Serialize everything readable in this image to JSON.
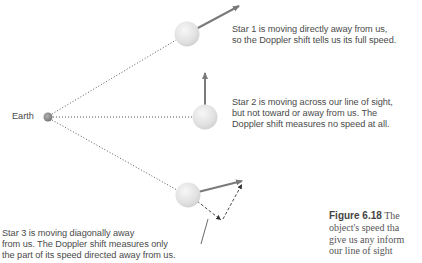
{
  "earth": {
    "label": "Earth"
  },
  "stars": [
    {
      "id": 1,
      "text_lines": [
        "Star 1 is moving directly away from us,",
        "so the Doppler shift tells us its full speed."
      ]
    },
    {
      "id": 2,
      "text_lines": [
        "Star 2 is moving across our line of sight,",
        "but not toward or away from us. The",
        "Doppler shift measures no speed at all."
      ]
    },
    {
      "id": 3,
      "text_lines": [
        "Star 3 is moving diagonally away",
        "from us. The Doppler shift measures only",
        "the part of its speed directed away from us."
      ]
    }
  ],
  "caption": {
    "figure_label": "Figure 6.18",
    "lines": [
      "The",
      "object's speed tha",
      "give us any inform",
      "our line of sight"
    ]
  },
  "colors": {
    "arrow": "#7a7a7a",
    "star_fill": "#e2e2e2",
    "earth_fill": "#8a8a8a",
    "dotted_line": "#555555",
    "text": "#4a4a4a"
  }
}
